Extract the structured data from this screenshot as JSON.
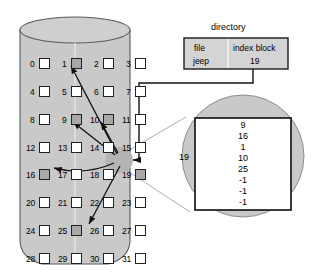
{
  "figure": {
    "colors": {
      "disk_fill": "#c9c9c9",
      "disk_stroke": "#555555",
      "block_free_fill": "#ffffff",
      "block_used_fill": "#a8a8a8",
      "block_stroke": "#222222",
      "line": "#111111",
      "bubble_fill": "#c9c9c9",
      "index_box_fill": "#ffffff",
      "directory_fill": "#d4d4d4",
      "text": "#000000"
    }
  },
  "disk": {
    "name": "disk-cylinder",
    "block_count": 32,
    "columns": 4,
    "rows": 8,
    "blocks": [
      {
        "id": 0,
        "label": "0",
        "used": false
      },
      {
        "id": 1,
        "label": "1",
        "used": true
      },
      {
        "id": 2,
        "label": "2",
        "used": false
      },
      {
        "id": 3,
        "label": "3",
        "used": false
      },
      {
        "id": 4,
        "label": "4",
        "used": false
      },
      {
        "id": 5,
        "label": "5",
        "used": false
      },
      {
        "id": 6,
        "label": "6",
        "used": false
      },
      {
        "id": 7,
        "label": "7",
        "used": false
      },
      {
        "id": 8,
        "label": "8",
        "used": false
      },
      {
        "id": 9,
        "label": "9",
        "used": true
      },
      {
        "id": 10,
        "label": "10",
        "used": true
      },
      {
        "id": 11,
        "label": "11",
        "used": false
      },
      {
        "id": 12,
        "label": "12",
        "used": false
      },
      {
        "id": 13,
        "label": "13",
        "used": false
      },
      {
        "id": 14,
        "label": "14",
        "used": false
      },
      {
        "id": 15,
        "label": "15",
        "used": false
      },
      {
        "id": 16,
        "label": "16",
        "used": true
      },
      {
        "id": 17,
        "label": "17",
        "used": false
      },
      {
        "id": 18,
        "label": "18",
        "used": false
      },
      {
        "id": 19,
        "label": "19",
        "used": true
      },
      {
        "id": 20,
        "label": "20",
        "used": false
      },
      {
        "id": 21,
        "label": "21",
        "used": false
      },
      {
        "id": 22,
        "label": "22",
        "used": false
      },
      {
        "id": 23,
        "label": "23",
        "used": false
      },
      {
        "id": 24,
        "label": "24",
        "used": false
      },
      {
        "id": 25,
        "label": "25",
        "used": true
      },
      {
        "id": 26,
        "label": "26",
        "used": false
      },
      {
        "id": 27,
        "label": "27",
        "used": false
      },
      {
        "id": 28,
        "label": "28",
        "used": false
      },
      {
        "id": 29,
        "label": "29",
        "used": false
      },
      {
        "id": 30,
        "label": "30",
        "used": false
      },
      {
        "id": 31,
        "label": "31",
        "used": false
      }
    ],
    "highlighted_block": 19,
    "pointer_targets": [
      1,
      9,
      10,
      16,
      25
    ]
  },
  "directory": {
    "title": "directory",
    "headers": {
      "file": "file",
      "index_block": "index block"
    },
    "row": {
      "file": "jeep",
      "index_block": "19"
    }
  },
  "index_block_bubble": {
    "name": "index-block-detail",
    "block_number": "19",
    "entries": [
      "9",
      "16",
      "1",
      "10",
      "25",
      "-1",
      "-1",
      "-1"
    ]
  }
}
